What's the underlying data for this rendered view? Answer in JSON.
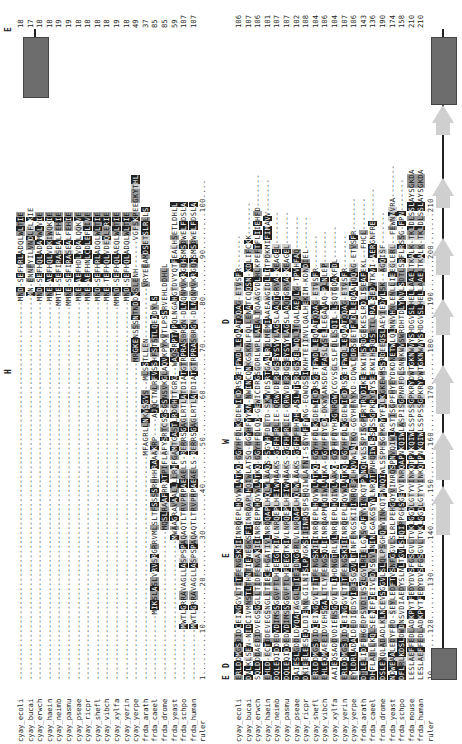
{
  "figure": {
    "type": "multiple-sequence-alignment",
    "orientation": "rotated-90-ccw",
    "highlight_colors": {
      "identical": "#222222",
      "conserved": "#9a9a9a",
      "similar": "#cfcfcf",
      "helix": "#6d6d6d",
      "strand": "#cfcfcf"
    }
  },
  "block1": {
    "annotations": [
      {
        "letter": "H",
        "pos": 44
      },
      {
        "letter": "E",
        "pos": 12
      }
    ],
    "rows": [
      {
        "label": "cyay_ecoli",
        "seq": "---------------------------------------------------------------------------------MND-SEFHRLADQLWLTIE",
        "end": "18"
      },
      {
        "label": "cyay_bucai",
        "seq": "----------------------------------------------------------------------------------MN-ENNFYILVNDLFLKIE",
        "end": "17"
      },
      {
        "label": "cyay_erwch",
        "seq": "---------------------------------------------------------------------------------MND-SEFHQLADAMWLVIE",
        "end": "18"
      },
      {
        "label": "cyay_haein",
        "seq": "---------------------------------------------------------------------------------MNE-AEFHQLVDKIWQKIE",
        "end": "18"
      },
      {
        "label": "cyay_neimb",
        "seq": "--------------------------------------------------------------------------------MMTE-SEFIRASEALFEHIE",
        "end": "19"
      },
      {
        "label": "cyay_pasmu",
        "seq": "--------------------------------------------------------------------------------MMNE-SEFIRASEALFEHIE",
        "end": "19"
      },
      {
        "label": "cyay_pseae",
        "seq": "---------------------------------------------------------------------------------MNE-AEFHDLVDALQQKVE",
        "end": "18"
      },
      {
        "label": "cyay_ricpr",
        "seq": "---------------------------------------------------------------------------------MNE-AEFHNLCDLEFLIVE",
        "end": "18"
      },
      {
        "label": "cyay_shefl",
        "seq": "---------------------------------------------------------------------------------MND-SEFHRLADQLWLTIE",
        "end": "18"
      },
      {
        "label": "cyay_vibch",
        "seq": "---------------------------------------------------------------------------------MNE-TEFHQLVDEQLERIE",
        "end": "18"
      },
      {
        "label": "cyay_xylfa",
        "seq": "--------------------------------------------------------------------------------MMND-SEFHQLAEQLWLTIE",
        "end": "19"
      },
      {
        "label": "cyay_yerin",
        "seq": "---------------------------------------------------------------------------------MND-SEFHQLADQLWLTIE",
        "end": "18"
      },
      {
        "label": "cyay_yerpe",
        "seq": "--------------------------------------------------------------------MRGKENSSSNTNDDKSLENH------VGFSKPEEGKYTHL",
        "end": "49"
      },
      {
        "label": "frda_arath",
        "seq": "------------------------------------------------MFAGRLLNKVSGVS--MLSSTLLEN-----------VRYEEAMDSETSLRLLS",
        "end": "37"
      },
      {
        "label": "frda_caeel",
        "seq": "--------------MIKSLASLVRVSRGRRVMLSLTFSSSSRHHHRAAAKRP----AJQCTNLRFVSSHFSTSTLQEDDYLS",
        "end": "85"
      },
      {
        "label": "frda_drome",
        "seq": "--------------------------------MQSLRAAFRRRTPIFLAFYSRTCSGSGSNSVKGLAQVKPYKVTLPSSRVEHLDDHLL",
        "end": "85"
      },
      {
        "label": "frda_yeast",
        "seq": "------------------------------MWAAGRAVAALLLLRHFGAMTGASTLRDGHTTGRG--WAQSRPTVPQLNGAHGTDVYQTFEALHSETLDHLL",
        "end": "59"
      },
      {
        "label": "frda_schpo",
        "seq": "-----------MWTLGRRAVAGLLASPSPAQAQTLTRVPRPAEAELS-RERRSGAGLRTLATDIATGTRPRASBRGN-DLNQNMVKRGQHSMSDWELFDSLA",
        "end": "107"
      },
      {
        "label": "frda_human",
        "seq": "-----------MWTLGRRAVAGLLASPSPAQAQTLTRVPRPAEAELS-RERRSGAGLRTLATDIATGTRPRASBRGN-DLNQNMVKRGQHSMSDWELFDSLA",
        "end": "107"
      }
    ],
    "ruler": {
      "label": "ruler",
      "seq": "1.........10........20........30........40........50........60........70........80........90........100...."
    },
    "secondary_structure": [
      {
        "type": "helix",
        "start": 90,
        "end": 104
      }
    ]
  },
  "block2": {
    "annotations": [
      {
        "letter": "E",
        "pos": 1
      },
      {
        "letter": "D",
        "pos": 3
      },
      {
        "letter": "E",
        "pos": 21
      },
      {
        "letter": "W",
        "pos": 41
      },
      {
        "letter": "D",
        "pos": 66
      }
    ],
    "rows": [
      {
        "label": "cyay_ecoli",
        "seq": "ERLDDMGSDIDCEINGGVLTITFENGSKIIINRQEPLHQVWLATKQ-GGYHFDLKGDEWICDRSGETFWDLLEQAATQQAG-ETVSFR-------",
        "end": "106"
      },
      {
        "label": "cyay_bucai",
        "seq": "DNLKLSEN-NIDCIVMNSTLTHNTIENEGKSFIINRQAPLHQIWLATSQ-GGYHFYYKN-NWINCQNKGSKNLFQLLENATCQQSN-KDLIFCKK-------",
        "end": "107"
      },
      {
        "label": "cyay_erwch",
        "seq": "SQLDDDAEDIDVEGSGGLLTIDFENGAKIIINRQEPMHQVWLATKQ-GGYHFDLQD-GEWICDRGSGDRLWPLLAEALTQAAGVDLHLKPEFTFLIIEHFD-------",
        "end": "106"
      },
      {
        "label": "cyay_haein",
        "seq": "EHLD-ECTDDEVEGSNGLLTIECEHGATIVLNRQQAPLHQLWLAAQS-SGYHFDLTD-SKWVDSRTGAALRDLMEMIAAEAWGIDLLITPDKMIFIMAVV-------",
        "end": "101"
      },
      {
        "label": "cyay_neimb",
        "seq": "DQLEQIDDEDVDIMSSGGVFTLHFEEGTKIVLNRQEPLHEIWMAAKS-GGFHFRLIE-QRWVDERDGSEYSVYLAGSLAAQTGRVA-KEAGEL-------",
        "end": "107"
      },
      {
        "label": "cyay_pasmu",
        "seq": "DQLEQIDDEDVDIMSSGGVFTLHFEEGTKIVLNRQEPLHEIWMAAKS-GGFHFRLIE-QRWVDERDGSEYSVYLAGSLAAQTGRVA-KEAGEL-------",
        "end": "107"
      },
      {
        "label": "cyay_pseae",
        "seq": "DAIESLGDDLDYQATAGGLLTIEFDNGGRLVLNRQAPLHQLWLAAKS-GGFHFHHDH-ASLWTSRDGSGELWQLLTQALAEVLG-TPVHFAQ-------",
        "end": "102"
      },
      {
        "label": "cyay_ricpr",
        "seq": "DKIEELEESEQLDIENNLGILNISLPNGKSIIINRQSPSHQIWLATNI-SGYHFFYNG-EQWQSSIKNHTEIINVLQALHEKIM-KDNDIEL-------",
        "end": "108"
      },
      {
        "label": "cyay_shefl",
        "seq": "ERLDDMGSDIDCEINGGVLTITFENGSKIIINRQEPLHQVWLATKQ-GGYHFDLKGDEWICDRSGETFWDLLEQAATQQAG-ETVSFR-------",
        "end": "104"
      },
      {
        "label": "cyay_vibch",
        "seq": "EHLEQMAEEIDVEHSGALLTLYFENGSQLIINRQAPMHQIWLATKA-GGYHFDYCD-DKWYANSDEAFASLVSELLEGAVAQ-PLNLEP-------",
        "end": "106"
      },
      {
        "label": "cyay_xylfa",
        "seq": "AAIEQSADDVDIENSGGVLTLIHDNGTRLVLNRQEPLHQIWLAAKQ-GGFHFDYHDGNRGWVCGVSGLSLFDLLSQIL-LSQTGQAKFDL-------",
        "end": "104"
      },
      {
        "label": "cyay_yerin",
        "seq": "ERLDDMGSDIDCEINGGVLTITFENGSKIIINRQEPLHQVWLATKQ-GGYHFDLKGDEWICDRSGETFWDLLEQAATQQAG-ETVSFR-------",
        "end": "107"
      },
      {
        "label": "cyay_yerpe",
        "seq": "EYLDRLADALDEDIGDSYIDESGGVLTINFENGSKIIINRQEPLHQVWLATKQ-GGYHFNYKD-DQWLCDRSGETFWDLLEQAATQQAG-ETVSFR-------",
        "end": "106"
      },
      {
        "label": "frda_arath",
        "seq": "DTLELIDFDHGFDPSVDIVSGLGVLRIELGNSGAFYVINKQTPNNQIWLSSPISGPFRTRYDIKEEKWIHSRDGEKESLRDLISEAFEKL--FHCL-------",
        "end": "143"
      },
      {
        "label": "frda_caeel",
        "seq": "DHFLADLLKQLSEENEFDEIVCDVSGVLNINLGAKGSYVLNRQTPNHQIWLSSPSSGPKRYDYSEEKWIHSRDSETLLRALSEDWTKVI-AERGNFRE-------",
        "end": "136"
      },
      {
        "label": "frda_drome",
        "seq": "DSLEKQLADADLKLNCEVSGGVLSLQLPSGHQWVINKQTPNNQIWLSSPHSGPKRYYFDLKGKEWMSSRDEEQSLAEVIEDYLSK--AGQISF-------",
        "end": "190"
      },
      {
        "label": "frda_yeast",
        "seq": "NDWEAALEDYFPD-SEYLEDFTVSNFGGVLSLRLPEHGQYVINRQSPNVQIWLASTISGPFHYEYDKDNETWLQLNNVHNLENLLIEEGLERL--FEWNNVRA-------",
        "end": "174"
      },
      {
        "label": "frda_schpo",
        "seq": "DFLRLKDSLDWDNSVDIAEDYSLNLTGVLSIQIPPGHSGEYVINRQAPNKQIWLASPISGPNRFDLSNNKWVSWRDHTDLYNVLSDTLSRFLRSSG-FPN-------",
        "end": "158"
      },
      {
        "label": "frda_mouse",
        "seq": "LESLAEFFEDLADKPYTFEDYDVSFGSGVLTVKLGGDLGTYVINKQTPNKQIWLSSPSSGPKRYDWTGKNWVYSHDGVSLHELLAAELTKALK-TKLDLSSLAYSGKDA",
        "end": "210"
      },
      {
        "label": "frda_human",
        "seq": "LESLAEFFEDLADKPYTFEDYDVSFGSGVLTVKLGGDLGTYVINKQTPNKQIWLSSPSSGPKRYDWTGKNWVYSHDGVSLHELLAAELTKALK-TKLDLSSLAYSGKDA",
        "end": "210"
      }
    ],
    "ruler": {
      "label": "ruler",
      "seq": "10........120.......130.......140.......150.......160.......170.......180.......190.......200.......210"
    },
    "secondary_structure": [
      {
        "type": "helix",
        "start": 0,
        "end": 5
      },
      {
        "type": "strand",
        "start": 24,
        "end": 32
      },
      {
        "type": "strand",
        "start": 33,
        "end": 41
      },
      {
        "type": "strand",
        "start": 44,
        "end": 52
      },
      {
        "type": "strand",
        "start": 57,
        "end": 63
      },
      {
        "type": "strand",
        "start": 67,
        "end": 73
      },
      {
        "type": "strand",
        "start": 78,
        "end": 83
      },
      {
        "type": "strand",
        "start": 90,
        "end": 95
      },
      {
        "type": "helix",
        "start": 95,
        "end": 106
      }
    ]
  }
}
